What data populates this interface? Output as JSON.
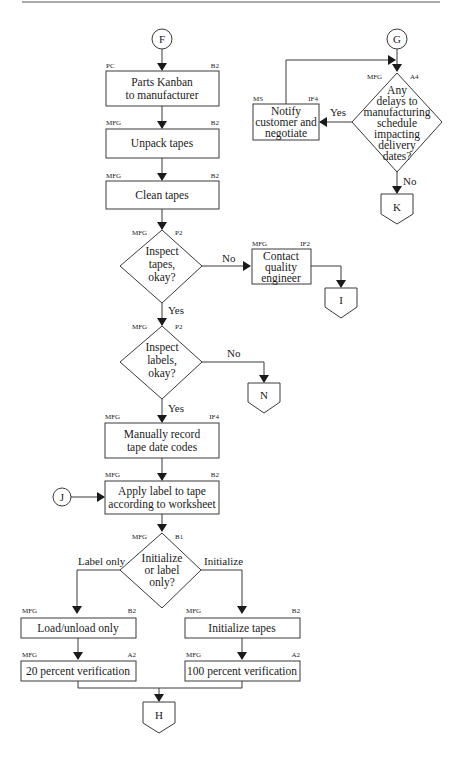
{
  "diagram": {
    "type": "flowchart",
    "connectors": {
      "F": "F",
      "G": "G",
      "J": "J",
      "offpage_I": "I",
      "offpage_N": "N",
      "offpage_K": "K",
      "offpage_H": "H"
    },
    "nodes": {
      "parts_kanban": {
        "line1": "Parts Kanban",
        "line2": "to manufacturer",
        "owner": "PC",
        "code": "B2"
      },
      "unpack": {
        "line1": "Unpack tapes",
        "owner": "MFG",
        "code": "B2"
      },
      "clean": {
        "line1": "Clean tapes",
        "owner": "MFG",
        "code": "B2"
      },
      "inspect_tapes": {
        "line1": "Inspect",
        "line2": "tapes,",
        "line3": "okay?",
        "owner": "MFG",
        "code": "P2"
      },
      "contact_qe": {
        "line1": "Contact",
        "line2": "quality",
        "line3": "engineer",
        "owner": "MFG",
        "code": "IF2"
      },
      "inspect_labels": {
        "line1": "Inspect",
        "line2": "labels,",
        "line3": "okay?",
        "owner": "MFG",
        "code": "P2"
      },
      "record_codes": {
        "line1": "Manually record",
        "line2": "tape date codes",
        "owner": "MFG",
        "code": "IF4"
      },
      "apply_label": {
        "line1": "Apply label to tape",
        "line2": "according to worksheet",
        "owner": "MFG",
        "code": "B2"
      },
      "init_or_label": {
        "line1": "Initialize",
        "line2": "or label",
        "line3": "only?",
        "owner": "MFG",
        "code": "B1"
      },
      "load_unload": {
        "line1": "Load/unload only",
        "owner": "MFG",
        "code": "B2"
      },
      "init_tapes": {
        "line1": "Initialize tapes",
        "owner": "MFG",
        "code": "B2"
      },
      "verify_20": {
        "line1": "20 percent verification",
        "owner": "MFG",
        "code": "A2"
      },
      "verify_100": {
        "line1": "100 percent verification",
        "owner": "MFG",
        "code": "A2"
      },
      "any_delays": {
        "line1": "Any",
        "line2": "delays to",
        "line3": "manufacturing",
        "line4": "schedule",
        "line5": "impacting",
        "line6": "delivery",
        "line7": "dates?",
        "owner": "MFG",
        "code": "A4"
      },
      "notify_customer": {
        "line1": "Notify",
        "line2": "customer and",
        "line3": "negotiate",
        "owner": "MS",
        "code": "IF4"
      }
    },
    "edge_labels": {
      "tapes_no": "No",
      "tapes_yes": "Yes",
      "labels_no": "No",
      "labels_yes": "Yes",
      "label_only": "Label only",
      "initialize": "Initialize",
      "delays_yes": "Yes",
      "delays_no": "No"
    }
  }
}
